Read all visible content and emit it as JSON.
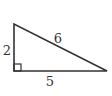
{
  "diagram": {
    "type": "right-triangle",
    "vertices": {
      "top": [
        14,
        24
      ],
      "bottom_left": [
        14,
        71
      ],
      "bottom_right": [
        107,
        71
      ]
    },
    "right_angle_at": "bottom_left",
    "labels": {
      "left_side": "2",
      "hypotenuse": "6",
      "bottom_side": "5"
    },
    "stroke_color": "#333333",
    "background": "#ffffff"
  }
}
